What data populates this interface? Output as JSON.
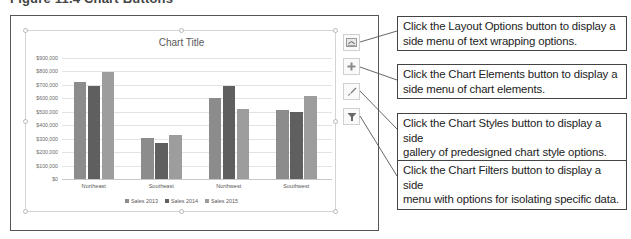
{
  "figure": {
    "header": "Figure 11.4 Chart Buttons"
  },
  "chart": {
    "title": "Chart Title",
    "y_ticks": [
      "$900,000",
      "$800,000",
      "$700,000",
      "$600,000",
      "$500,000",
      "$400,000",
      "$300,000",
      "$200,000",
      "$100,000",
      "$0"
    ],
    "categories": [
      "Northeast",
      "Southeast",
      "Northwest",
      "Southwest"
    ],
    "legend": [
      {
        "label": "Sales 2013",
        "color": "#8c8c8c"
      },
      {
        "label": "Sales 2014",
        "color": "#5f5f5f"
      },
      {
        "label": "Sales 2015",
        "color": "#9d9d9d"
      }
    ]
  },
  "chart_data": {
    "type": "bar",
    "title": "Chart Title",
    "xlabel": "",
    "ylabel": "",
    "categories": [
      "Northeast",
      "Southeast",
      "Northwest",
      "Southwest"
    ],
    "series": [
      {
        "name": "Sales 2013",
        "values": [
          725000,
          305000,
          605000,
          515000
        ]
      },
      {
        "name": "Sales 2014",
        "values": [
          695000,
          270000,
          695000,
          495000
        ]
      },
      {
        "name": "Sales 2015",
        "values": [
          795000,
          325000,
          520000,
          615000
        ]
      }
    ],
    "ylim": [
      0,
      900000
    ],
    "y_tick_step": 100000,
    "grid": true,
    "legend_position": "bottom"
  },
  "chart_buttons": [
    {
      "name": "Layout Options",
      "icon": "layout-options-icon"
    },
    {
      "name": "Chart Elements",
      "icon": "plus-icon"
    },
    {
      "name": "Chart Styles",
      "icon": "paintbrush-icon"
    },
    {
      "name": "Chart Filters",
      "icon": "filter-funnel-icon"
    }
  ],
  "callouts": [
    {
      "line1": "Click the Layout Options button to display a",
      "line2": "side menu of text wrapping options."
    },
    {
      "line1": "Click the Chart Elements button to display a",
      "line2": "side menu of chart elements."
    },
    {
      "line1": "Click the Chart Styles button to display a side",
      "line2": "gallery of predesigned chart style options."
    },
    {
      "line1": "Click the Chart Filters button to display a side",
      "line2": "menu with options for isolating specific data."
    }
  ]
}
